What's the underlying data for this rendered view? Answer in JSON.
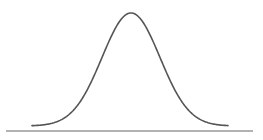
{
  "diagram": {
    "type": "normal-distribution-curve",
    "curve_color": "#555555",
    "baseline_color": "#999999",
    "mean_x": 131,
    "sigma_px": 29,
    "peak_y": 13,
    "tail_y": 126,
    "tail_left_x": 32,
    "tail_right_x": 228,
    "baseline": {
      "x1": 6,
      "x2": 253,
      "y": 131
    }
  }
}
